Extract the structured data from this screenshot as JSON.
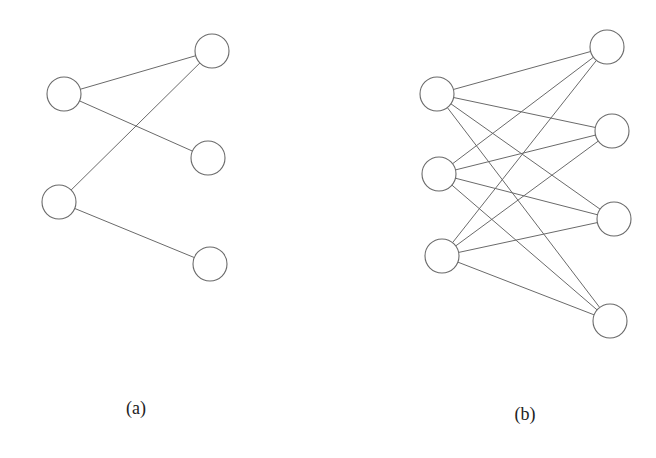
{
  "figures": [
    {
      "id": "a",
      "label": "(a)",
      "label_pos": [
        136,
        414
      ],
      "node_radius": 17,
      "nodes": [
        {
          "id": "a_L1",
          "side": "left",
          "cx": 64,
          "cy": 94
        },
        {
          "id": "a_L2",
          "side": "left",
          "cx": 59,
          "cy": 202
        },
        {
          "id": "a_R1",
          "side": "right",
          "cx": 212,
          "cy": 51
        },
        {
          "id": "a_R2",
          "side": "right",
          "cx": 208,
          "cy": 158
        },
        {
          "id": "a_R3",
          "side": "right",
          "cx": 210,
          "cy": 264
        }
      ],
      "edges": [
        [
          "a_L1",
          "a_R1"
        ],
        [
          "a_L1",
          "a_R2"
        ],
        [
          "a_L2",
          "a_R1"
        ],
        [
          "a_L2",
          "a_R3"
        ]
      ]
    },
    {
      "id": "b",
      "label": "(b)",
      "label_pos": [
        525,
        420
      ],
      "node_radius": 17,
      "nodes": [
        {
          "id": "b_L1",
          "side": "left",
          "cx": 437,
          "cy": 94
        },
        {
          "id": "b_L2",
          "side": "left",
          "cx": 439,
          "cy": 174
        },
        {
          "id": "b_L3",
          "side": "left",
          "cx": 442,
          "cy": 256
        },
        {
          "id": "b_R1",
          "side": "right",
          "cx": 607,
          "cy": 47
        },
        {
          "id": "b_R2",
          "side": "right",
          "cx": 612,
          "cy": 131
        },
        {
          "id": "b_R3",
          "side": "right",
          "cx": 614,
          "cy": 219
        },
        {
          "id": "b_R4",
          "side": "right",
          "cx": 610,
          "cy": 321
        }
      ],
      "edges": [
        [
          "b_L1",
          "b_R1"
        ],
        [
          "b_L1",
          "b_R2"
        ],
        [
          "b_L1",
          "b_R3"
        ],
        [
          "b_L1",
          "b_R4"
        ],
        [
          "b_L2",
          "b_R1"
        ],
        [
          "b_L2",
          "b_R2"
        ],
        [
          "b_L2",
          "b_R3"
        ],
        [
          "b_L2",
          "b_R4"
        ],
        [
          "b_L3",
          "b_R1"
        ],
        [
          "b_L3",
          "b_R2"
        ],
        [
          "b_L3",
          "b_R3"
        ],
        [
          "b_L3",
          "b_R4"
        ]
      ]
    }
  ],
  "colors": {
    "stroke": "#6a6a6a",
    "node_fill": "#ffffff",
    "label": "#222222",
    "background": "#ffffff"
  }
}
